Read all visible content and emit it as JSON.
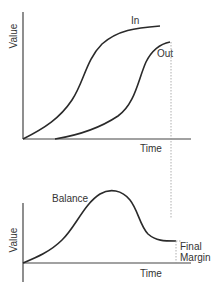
{
  "diagram": {
    "top_chart": {
      "y_label": "Value",
      "x_label": "Time",
      "series": [
        {
          "name": "In",
          "label": "In"
        },
        {
          "name": "Out",
          "label": "Out"
        }
      ]
    },
    "bottom_chart": {
      "y_label": "Value",
      "x_label": "Time",
      "series": [
        {
          "name": "Balance",
          "label": "Balance"
        }
      ],
      "annotation": {
        "line1": "Final",
        "line2": "Margin"
      }
    },
    "colors": {
      "curve": "#2a2a2a",
      "axis": "#444444",
      "dotted": "#9a9a9a",
      "text": "#333333"
    }
  }
}
